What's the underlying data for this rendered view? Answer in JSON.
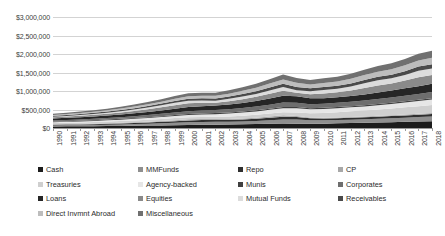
{
  "chart_data": {
    "type": "area",
    "stacked": true,
    "title": "",
    "subtitle": "",
    "xlabel": "",
    "ylabel": "",
    "grid": true,
    "legend_position": "bottom",
    "ylim": [
      0,
      3000000
    ],
    "ytick_labels": [
      "$3,000,000",
      "$2,500,000",
      "$2,000,000",
      "$1,500,000",
      "$1,000,000",
      "$500,000",
      "$0"
    ],
    "ytick_values": [
      3000000,
      2500000,
      2000000,
      1500000,
      1000000,
      500000,
      0
    ],
    "categories": [
      "1990",
      "1991",
      "1992",
      "1993",
      "1994",
      "1995",
      "1996",
      "1997",
      "1998",
      "1999",
      "2000",
      "2001",
      "2002",
      "2003",
      "2004",
      "2005",
      "2006",
      "2007",
      "2008",
      "2009",
      "2010",
      "2011",
      "2012",
      "2013",
      "2014",
      "2015",
      "2016",
      "2017",
      "2018"
    ],
    "series": [
      {
        "name": "Cash",
        "color": "#1c1c1c",
        "values": [
          42000,
          44000,
          46000,
          49000,
          52000,
          56000,
          60000,
          65000,
          70000,
          76000,
          82000,
          86000,
          90000,
          95000,
          101000,
          108000,
          116000,
          124000,
          118000,
          112000,
          118000,
          126000,
          134000,
          142000,
          150000,
          158000,
          166000,
          174000,
          182000
        ]
      },
      {
        "name": "MMFunds",
        "color": "#8f8f8f",
        "values": [
          28000,
          30000,
          31000,
          33000,
          36000,
          40000,
          45000,
          51000,
          58000,
          66000,
          74000,
          78000,
          76000,
          74000,
          76000,
          82000,
          92000,
          104000,
          112000,
          98000,
          92000,
          90000,
          92000,
          95000,
          100000,
          106000,
          113000,
          120000,
          128000
        ]
      },
      {
        "name": "Repo",
        "color": "#2f2f2f",
        "values": [
          18000,
          19000,
          20000,
          22000,
          24000,
          27000,
          30000,
          34000,
          38000,
          43000,
          48000,
          50000,
          50000,
          52000,
          56000,
          62000,
          70000,
          78000,
          66000,
          52000,
          50000,
          50000,
          51000,
          53000,
          55000,
          58000,
          61000,
          64000,
          67000
        ]
      },
      {
        "name": "CP",
        "color": "#a8a8a8",
        "values": [
          12000,
          13000,
          13500,
          14000,
          15000,
          17000,
          19000,
          21000,
          24000,
          27000,
          30000,
          28000,
          25000,
          24000,
          25000,
          28000,
          32000,
          37000,
          30000,
          22000,
          20000,
          20000,
          21000,
          22000,
          23000,
          24000,
          26000,
          27000,
          29000
        ]
      },
      {
        "name": "Treasuries",
        "color": "#cfcfcf",
        "values": [
          34000,
          37000,
          40000,
          43000,
          46000,
          49000,
          52000,
          54000,
          55000,
          55000,
          54000,
          56000,
          60000,
          66000,
          72000,
          76000,
          80000,
          84000,
          96000,
          112000,
          128000,
          142000,
          152000,
          160000,
          170000,
          180000,
          192000,
          204000,
          218000
        ]
      },
      {
        "name": "Agency-backed",
        "color": "#e6e6e6",
        "values": [
          22000,
          25000,
          28000,
          31000,
          34000,
          37000,
          41000,
          45000,
          50000,
          56000,
          62000,
          68000,
          74000,
          80000,
          86000,
          92000,
          100000,
          108000,
          112000,
          108000,
          106000,
          106000,
          108000,
          112000,
          118000,
          124000,
          131000,
          138000,
          146000
        ]
      },
      {
        "name": "Munis",
        "color": "#404040",
        "values": [
          16000,
          17000,
          18000,
          19000,
          20000,
          21000,
          22000,
          23000,
          24000,
          25000,
          26000,
          27000,
          28000,
          29000,
          30000,
          31000,
          33000,
          35000,
          34000,
          33000,
          33000,
          33000,
          33000,
          33000,
          34000,
          34000,
          35000,
          36000,
          37000
        ]
      },
      {
        "name": "Corporates",
        "color": "#6e6e6e",
        "values": [
          30000,
          32000,
          35000,
          38000,
          42000,
          46000,
          51000,
          57000,
          63000,
          70000,
          77000,
          80000,
          82000,
          86000,
          92000,
          99000,
          108000,
          118000,
          112000,
          104000,
          108000,
          114000,
          120000,
          127000,
          134000,
          142000,
          150000,
          158000,
          167000
        ]
      },
      {
        "name": "Loans",
        "color": "#262626",
        "values": [
          56000,
          58000,
          60000,
          63000,
          67000,
          72000,
          78000,
          85000,
          93000,
          102000,
          112000,
          118000,
          122000,
          128000,
          138000,
          150000,
          166000,
          182000,
          178000,
          160000,
          152000,
          152000,
          156000,
          164000,
          174000,
          185000,
          197000,
          209000,
          222000
        ]
      },
      {
        "name": "Equities",
        "color": "#8a8a8a",
        "values": [
          30000,
          34000,
          38000,
          43000,
          47000,
          54000,
          62000,
          72000,
          84000,
          98000,
          104000,
          92000,
          78000,
          92000,
          104000,
          114000,
          128000,
          140000,
          96000,
          112000,
          128000,
          130000,
          146000,
          176000,
          192000,
          192000,
          210000,
          244000,
          238000
        ]
      },
      {
        "name": "Mutual Funds",
        "color": "#dcdcdc",
        "values": [
          14000,
          17000,
          20000,
          24000,
          27000,
          32000,
          38000,
          45000,
          53000,
          62000,
          66000,
          60000,
          52000,
          62000,
          70000,
          78000,
          88000,
          98000,
          68000,
          82000,
          94000,
          96000,
          108000,
          128000,
          140000,
          140000,
          152000,
          176000,
          174000
        ]
      },
      {
        "name": "Receivables",
        "color": "#4a4a4a",
        "values": [
          26000,
          27000,
          29000,
          31000,
          33000,
          36000,
          39000,
          43000,
          47000,
          52000,
          57000,
          59000,
          60000,
          63000,
          68000,
          74000,
          82000,
          90000,
          86000,
          78000,
          78000,
          80000,
          83000,
          87000,
          92000,
          97000,
          103000,
          109000,
          116000
        ]
      },
      {
        "name": "Direct Invmnt Abroad",
        "color": "#bdbdbd",
        "values": [
          24000,
          26000,
          28000,
          31000,
          34000,
          38000,
          42000,
          47000,
          53000,
          60000,
          67000,
          70000,
          72000,
          78000,
          86000,
          94000,
          105000,
          116000,
          112000,
          106000,
          112000,
          118000,
          124000,
          132000,
          140000,
          148000,
          157000,
          166000,
          176000
        ]
      },
      {
        "name": "Miscellaneous",
        "color": "#707070",
        "values": [
          34000,
          36000,
          39000,
          42000,
          45000,
          49000,
          54000,
          60000,
          66000,
          73000,
          81000,
          84000,
          86000,
          92000,
          100000,
          109000,
          120000,
          132000,
          128000,
          120000,
          124000,
          130000,
          136000,
          144000,
          152000,
          161000,
          170000,
          180000,
          190000
        ]
      }
    ]
  },
  "legend": {
    "rows": [
      [
        {
          "label": "Cash",
          "color": "#1c1c1c"
        },
        {
          "label": "MMFunds",
          "color": "#8f8f8f"
        },
        {
          "label": "Repo",
          "color": "#2f2f2f"
        },
        {
          "label": "CP",
          "color": "#a8a8a8"
        }
      ],
      [
        {
          "label": "Treasuries",
          "color": "#cfcfcf"
        },
        {
          "label": "Agency-backed",
          "color": "#e6e6e6"
        },
        {
          "label": "Munis",
          "color": "#404040"
        },
        {
          "label": "Corporates",
          "color": "#6e6e6e"
        }
      ],
      [
        {
          "label": "Loans",
          "color": "#262626"
        },
        {
          "label": "Equities",
          "color": "#8a8a8a"
        },
        {
          "label": "Mutual Funds",
          "color": "#dcdcdc"
        },
        {
          "label": "Receivables",
          "color": "#4a4a4a"
        }
      ],
      [
        {
          "label": "Direct Invmnt Abroad",
          "color": "#bdbdbd"
        },
        {
          "label": "Miscellaneous",
          "color": "#707070"
        }
      ]
    ],
    "column_offsets": [
      0,
      100,
      200,
      300
    ]
  }
}
